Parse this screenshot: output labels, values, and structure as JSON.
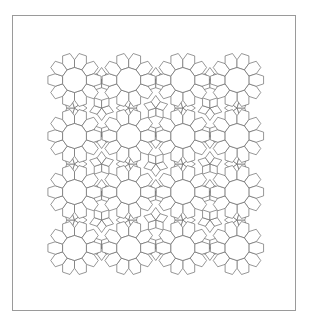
{
  "canvas": {
    "width": 314,
    "height": 327
  },
  "figure": {
    "type": "decagon-hexagon quasi-periodic tiling",
    "frame": {
      "x": 12,
      "y": 15,
      "width": 284,
      "height": 296,
      "stroke": "#9a9a9a"
    },
    "stroke_color": "#6a6a6a",
    "stroke_width": 0.7,
    "fill_color": "#ffffff",
    "decagon_radius": 12.5,
    "rosette_grid": {
      "columns_x": [
        74.5,
        128.7,
        182.8,
        237.0
      ],
      "rows_y": [
        80,
        136,
        192,
        248
      ]
    },
    "pattern_bounds": {
      "left": 41,
      "top": 45,
      "right": 270,
      "bottom": 282
    }
  }
}
